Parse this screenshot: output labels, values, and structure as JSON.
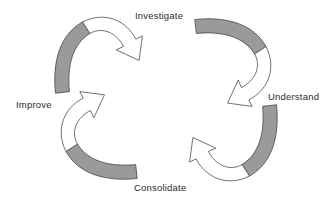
{
  "diagram": {
    "type": "cyclic-process",
    "direction": "clockwise",
    "background_color": "#ffffff",
    "arrow_fill_color": "#9a9a9a",
    "arrow_head_fill_color": "#ffffff",
    "arrow_stroke_color": "#3d3d3d",
    "label_color": "#2b2b2b",
    "stages": [
      {
        "id": "investigate",
        "label": "Investigate",
        "position": "top-center",
        "order": 1
      },
      {
        "id": "understand",
        "label": "Understand",
        "position": "right",
        "order": 2
      },
      {
        "id": "consolidate",
        "label": "Consolidate",
        "position": "bottom-center",
        "order": 3
      },
      {
        "id": "improve",
        "label": "Improve",
        "position": "left",
        "order": 4
      }
    ],
    "arrows": [
      {
        "id": "arrow-top-left",
        "from": "improve",
        "to": "investigate",
        "quadrant": "top-left",
        "head_direction": "right-down"
      },
      {
        "id": "arrow-top-right",
        "from": "investigate",
        "to": "understand",
        "quadrant": "top-right",
        "head_direction": "down"
      },
      {
        "id": "arrow-bottom-right",
        "from": "understand",
        "to": "consolidate",
        "quadrant": "bottom-right",
        "head_direction": "left"
      },
      {
        "id": "arrow-bottom-left",
        "from": "consolidate",
        "to": "improve",
        "quadrant": "bottom-left",
        "head_direction": "up"
      }
    ]
  }
}
